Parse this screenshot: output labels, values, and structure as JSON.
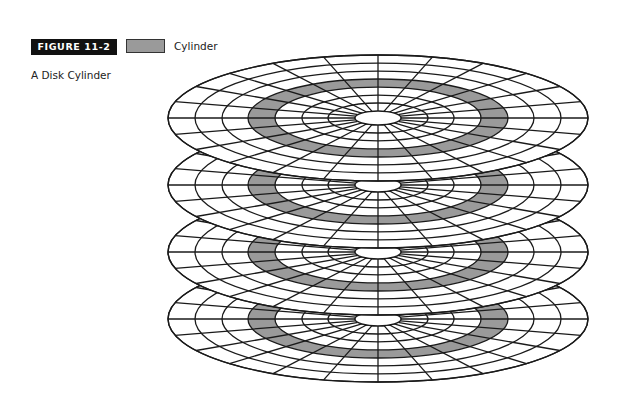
{
  "figure": {
    "label": "FIGURE 11-2",
    "caption": "A Disk Cylinder"
  },
  "legend": {
    "items": [
      {
        "label": "Cylinder",
        "color": "#9a9a9a"
      }
    ]
  },
  "diagram": {
    "type": "disk-platter-stack",
    "platter_count": 4,
    "center_x": 378,
    "center_ys": [
      118,
      185,
      252,
      319
    ],
    "outer_rx": 210,
    "outer_ry": 63,
    "track_radii_rx": [
      23,
      50,
      76,
      103,
      130,
      156,
      183,
      210
    ],
    "sector_count": 24,
    "highlighted_track_index": 3,
    "colors": {
      "stroke": "#1a1a1a",
      "platter_fill": "#ffffff",
      "cylinder_fill": "#9a9a9a"
    }
  }
}
